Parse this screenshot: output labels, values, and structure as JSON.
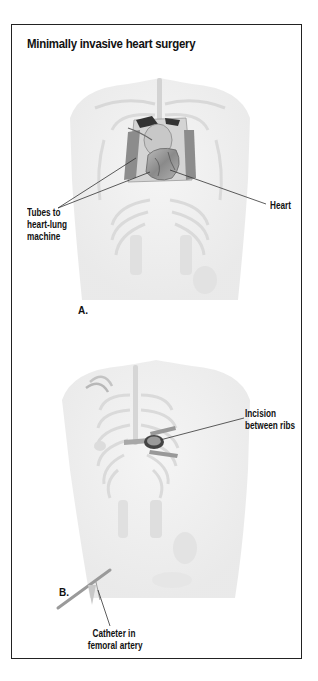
{
  "figure": {
    "title": "Minimally invasive heart surgery",
    "panels": [
      {
        "id": "A",
        "letter": "A.",
        "labels": {
          "tubes": [
            "Tubes to",
            "heart-lung",
            "machine"
          ],
          "heart": "Heart"
        }
      },
      {
        "id": "B",
        "letter": "B.",
        "labels": {
          "incision": [
            "Incision",
            "between ribs"
          ],
          "catheter": [
            "Catheter in",
            "femoral artery"
          ]
        }
      }
    ]
  },
  "colors": {
    "border": "#222222",
    "body_fill": "#efefef",
    "rib_stroke": "#dcdcdc",
    "organ_dark": "#555555",
    "leader_line": "#333333"
  }
}
